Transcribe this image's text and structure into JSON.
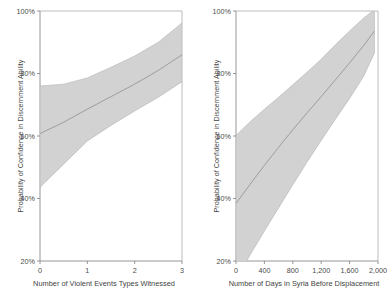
{
  "figure": {
    "background": "#ffffff",
    "band_color": "#d2d2d2",
    "line_color": "#8f8f8f",
    "axis_color": "#8a8a8a"
  },
  "panels": [
    {
      "id": "violent-events",
      "ylabel": "Probability of Confidence in Discernment Ability",
      "xlabel": "Number of Violent Events Types Witnessed",
      "yticks": [
        "20%",
        "40%",
        "60%",
        "80%",
        "100%"
      ],
      "xticks": [
        "0",
        "1",
        "2",
        "3"
      ]
    },
    {
      "id": "days-in-syria",
      "ylabel": "Probability of Confidence in Discernment Ability",
      "xlabel": "Number of Days in Syria Before Displacement",
      "yticks": [
        "20%",
        "40%",
        "60%",
        "80%",
        "100%"
      ],
      "xticks": [
        "0",
        "400",
        "800",
        "1,200",
        "1,600",
        "2,000"
      ]
    }
  ],
  "chart_data": [
    {
      "type": "line",
      "title": "",
      "subtitle": "",
      "xlabel": "Number of Violent Events Types Witnessed",
      "ylabel": "Probability of Confidence in Discernment Ability",
      "xlim": [
        0,
        3
      ],
      "ylim": [
        20,
        100
      ],
      "xticks": [
        0,
        1,
        2,
        3
      ],
      "xticklabels": [
        "0",
        "1",
        "2",
        "3"
      ],
      "yticks": [
        20,
        40,
        60,
        80,
        100
      ],
      "yticklabels": [
        "20%",
        "40%",
        "60%",
        "80%",
        "100%"
      ],
      "grid": false,
      "legend": "none",
      "x": [
        0,
        0.5,
        1,
        1.5,
        2,
        2.5,
        3
      ],
      "series": [
        {
          "name": "Predicted probability",
          "values": [
            60.8,
            64.4,
            68.6,
            72.6,
            76.6,
            81.0,
            86.0
          ]
        },
        {
          "name": "95% CI upper",
          "values": [
            76.0,
            76.6,
            78.6,
            82.0,
            85.6,
            90.0,
            96.2
          ]
        },
        {
          "name": "95% CI lower",
          "values": [
            43.6,
            51.0,
            58.4,
            63.4,
            68.0,
            72.4,
            77.4
          ]
        }
      ]
    },
    {
      "type": "line",
      "title": "",
      "subtitle": "",
      "xlabel": "Number of Days in Syria Before Displacement",
      "ylabel": "Probability of Confidence in Discernment Ability",
      "xlim": [
        0,
        2000
      ],
      "ylim": [
        20,
        100
      ],
      "xticks": [
        0,
        400,
        800,
        1200,
        1600,
        2000
      ],
      "xticklabels": [
        "0",
        "400",
        "800",
        "1,200",
        "1,600",
        "2,000"
      ],
      "yticks": [
        20,
        40,
        60,
        80,
        100
      ],
      "yticklabels": [
        "20%",
        "40%",
        "60%",
        "80%",
        "100%"
      ],
      "grid": false,
      "legend": "none",
      "x": [
        0,
        200,
        400,
        600,
        800,
        1000,
        1200,
        1400,
        1600,
        1800,
        1950
      ],
      "series": [
        {
          "name": "Predicted probability",
          "values": [
            38.4,
            44.6,
            50.6,
            56.4,
            62.0,
            67.4,
            72.6,
            78.0,
            83.4,
            89.0,
            93.6
          ]
        },
        {
          "name": "95% CI upper",
          "values": [
            60.2,
            64.6,
            68.6,
            72.4,
            76.4,
            80.4,
            84.6,
            89.2,
            93.6,
            97.8,
            100.4
          ]
        },
        {
          "name": "95% CI lower",
          "values": [
            13.6,
            22.0,
            29.6,
            37.0,
            44.4,
            51.6,
            58.6,
            65.4,
            72.0,
            79.2,
            86.6
          ]
        }
      ]
    }
  ]
}
